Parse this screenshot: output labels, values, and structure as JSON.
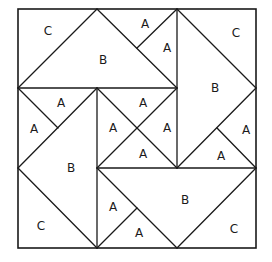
{
  "diagram": {
    "type": "quilt-block-pattern",
    "line_color": "#1a1a1a",
    "background": "#ffffff",
    "labels": [
      {
        "text": "C",
        "x": 48,
        "y": 31
      },
      {
        "text": "B",
        "x": 103,
        "y": 60
      },
      {
        "text": "A",
        "x": 145,
        "y": 24
      },
      {
        "text": "A",
        "x": 167,
        "y": 48
      },
      {
        "text": "C",
        "x": 236,
        "y": 33
      },
      {
        "text": "B",
        "x": 215,
        "y": 88
      },
      {
        "text": "A",
        "x": 61,
        "y": 103
      },
      {
        "text": "A",
        "x": 143,
        "y": 103
      },
      {
        "text": "A",
        "x": 34,
        "y": 129
      },
      {
        "text": "A",
        "x": 113,
        "y": 128
      },
      {
        "text": "A",
        "x": 167,
        "y": 128
      },
      {
        "text": "A",
        "x": 246,
        "y": 130
      },
      {
        "text": "B",
        "x": 71,
        "y": 168
      },
      {
        "text": "A",
        "x": 143,
        "y": 154
      },
      {
        "text": "A",
        "x": 221,
        "y": 156
      },
      {
        "text": "B",
        "x": 185,
        "y": 200
      },
      {
        "text": "C",
        "x": 41,
        "y": 226
      },
      {
        "text": "A",
        "x": 113,
        "y": 207
      },
      {
        "text": "A",
        "x": 139,
        "y": 233
      },
      {
        "text": "C",
        "x": 234,
        "y": 229
      }
    ]
  }
}
